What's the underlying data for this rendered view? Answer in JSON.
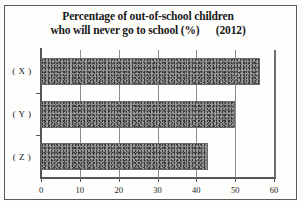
{
  "chart_data": {
    "type": "bar",
    "orientation": "horizontal",
    "title": "Percentage of out-of-school children who will never go to school (%)    (2012)",
    "title_line_1": "Percentage of out-of-school children",
    "title_line_2": "who will never go to school (%)      (2012)",
    "categories": [
      "( X )",
      "( Y )",
      "( Z )"
    ],
    "values": [
      56.5,
      50,
      43
    ],
    "xlabel": "",
    "ylabel": "",
    "xlim": [
      0,
      60
    ],
    "xticks": [
      0,
      10,
      20,
      30,
      40,
      50,
      60
    ],
    "xtick_labels": [
      "0",
      "10",
      "20",
      "30",
      "40",
      "50",
      "60"
    ],
    "grid": true,
    "grid_axis": "x",
    "legend": null,
    "year": "2012",
    "unit": "%",
    "bar_color": "#8f8f8f"
  },
  "figure": {
    "background_color": "#fefefc",
    "frame_color": "#5b5b5b",
    "axis_color": "#555555",
    "gridline_color": "#8c8c8c"
  }
}
